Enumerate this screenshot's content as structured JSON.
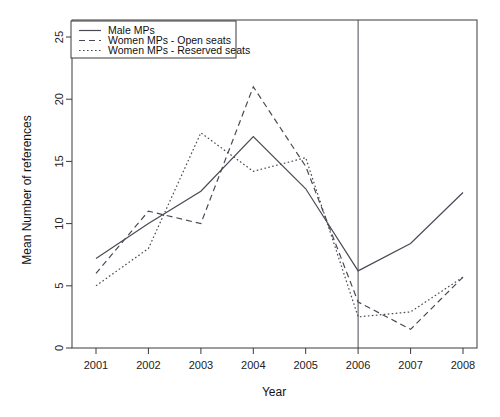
{
  "chart_data": {
    "type": "line",
    "title": "",
    "xlabel": "Year",
    "ylabel": "Mean Number of references",
    "x": [
      2001,
      2002,
      2003,
      2004,
      2005,
      2006,
      2007,
      2008
    ],
    "xlim": [
      2000.6,
      2008.4
    ],
    "ylim": [
      0,
      25.6
    ],
    "x_ticks": [
      "2001",
      "2002",
      "2003",
      "2004",
      "2005",
      "2006",
      "2007",
      "2008"
    ],
    "y_ticks": [
      "0",
      "5",
      "10",
      "15",
      "20",
      "25"
    ],
    "y_tick_values": [
      0,
      5,
      10,
      15,
      20,
      25
    ],
    "grid": false,
    "legend_position": "top-left",
    "annotations": [
      {
        "type": "vertical-line",
        "x": 2006,
        "label": ""
      }
    ],
    "series": [
      {
        "name": "Male MPs",
        "style": "solid",
        "color": "#4a4a55",
        "values": [
          7.2,
          10.0,
          12.6,
          17.0,
          12.8,
          6.2,
          8.4,
          12.5
        ]
      },
      {
        "name": "Women MPs - Open  seats",
        "style": "dashed",
        "color": "#4a4a55",
        "values": [
          6.0,
          11.0,
          10.0,
          21.0,
          14.6,
          3.7,
          1.5,
          5.7
        ]
      },
      {
        "name": "Women MPs - Reserved seats",
        "style": "dotted",
        "color": "#4a4a55",
        "values": [
          5.0,
          8.0,
          17.3,
          14.2,
          15.3,
          2.5,
          2.9,
          5.7
        ]
      }
    ]
  },
  "legend": {
    "entries": [
      {
        "label": "Male MPs",
        "style": "solid"
      },
      {
        "label": "Women MPs - Open  seats",
        "style": "dashed"
      },
      {
        "label": "Women MPs - Reserved seats",
        "style": "dotted"
      }
    ]
  },
  "axes": {
    "x_title": "Year",
    "y_title": "Mean Number of references"
  }
}
